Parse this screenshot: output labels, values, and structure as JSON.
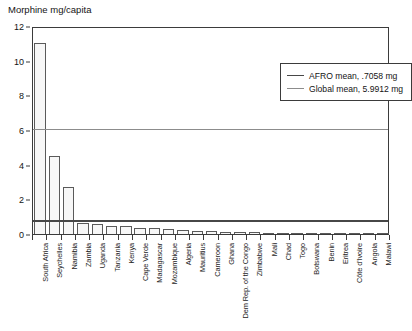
{
  "chart_data": {
    "type": "bar",
    "title": "Morphine mg/capita",
    "xlabel": "",
    "ylabel": "",
    "ylim": [
      0,
      12
    ],
    "yticks": [
      0,
      2,
      4,
      6,
      8,
      10,
      12
    ],
    "grid": false,
    "legend_position": "top-right",
    "categories": [
      "South Africa",
      "Seychelles",
      "Namibia",
      "Zambia",
      "Uganda",
      "Tanzania",
      "Kenya",
      "Cape Verde",
      "Madagascar",
      "Mozambique",
      "Algeria",
      "Mauritius",
      "Cameroon",
      "Ghana",
      "Dem Rep. of the Congo",
      "Zimbabwe",
      "Mali",
      "Chad",
      "Togo",
      "Botswana",
      "Benin",
      "Eritrea",
      "Côte d'Ivoire",
      "Angola",
      "Malawi"
    ],
    "values": [
      11.0,
      4.5,
      2.7,
      0.62,
      0.6,
      0.46,
      0.44,
      0.36,
      0.33,
      0.3,
      0.25,
      0.2,
      0.17,
      0.14,
      0.12,
      0.1,
      0.08,
      0.07,
      0.06,
      0.05,
      0.04,
      0.03,
      0.03,
      0.02,
      0.02
    ],
    "reference_lines": [
      {
        "key": "afro",
        "label": "AFRO mean, .7058 mg",
        "value": 0.7058,
        "color": "#474747"
      },
      {
        "key": "global",
        "label": "Global mean, 5.9912 mg",
        "value": 5.9912,
        "color": "#8c8c8c"
      }
    ]
  },
  "legend": {
    "items": [
      {
        "label": "AFRO mean, .7058 mg"
      },
      {
        "label": "Global mean, 5.9912 mg"
      }
    ]
  },
  "colors": {
    "bar_fill": "#f7f7f7",
    "bar_edge": "#5a5a5a",
    "axis": "#3b3b3b",
    "afro_line": "#474747",
    "global_line": "#8c8c8c",
    "background": "#ffffff"
  }
}
